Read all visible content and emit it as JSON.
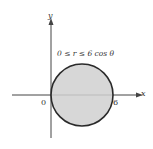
{
  "diagram": {
    "region_label": "0 ≤ r ≤ 6 cos θ",
    "x_axis_label": "x",
    "y_axis_label": "y",
    "origin_label": "0",
    "x_tick_label": "6",
    "colors": {
      "fill": "#d0d0d0",
      "stroke": "#2a2a2a",
      "axis": "#444444"
    }
  }
}
